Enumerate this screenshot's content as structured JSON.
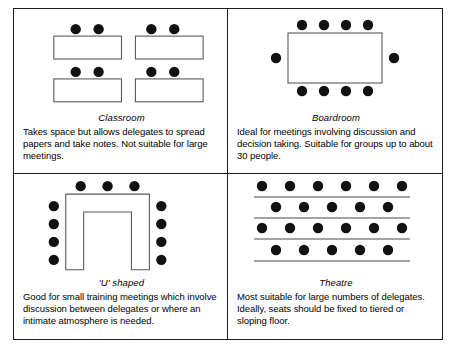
{
  "figure": {
    "panel_count": 4
  },
  "panels": [
    {
      "id": "classroom",
      "title": "Classroom",
      "description": "Takes space but allows delegates to spread papers and take notes. Not suitable for large meetings.",
      "diagram": {
        "type": "classroom",
        "tables": 4,
        "seats_per_table": 2,
        "total_seats": 8,
        "arrangement": "2 by 2 grid of rectangular tables, two delegates seated behind each table"
      }
    },
    {
      "id": "boardroom",
      "title": "Boardroom",
      "description": "Ideal for meetings involving discussion and decision taking. Suitable for groups up to about 30 people.",
      "diagram": {
        "type": "boardroom",
        "tables": 1,
        "seats_top": 4,
        "seats_bottom": 4,
        "seats_left": 1,
        "seats_right": 1,
        "total_seats": 10,
        "arrangement": "single large rectangular table with delegates seated all around"
      }
    },
    {
      "id": "u-shaped",
      "title": "'U' shaped",
      "description": "Good for small training meetings which involve discussion between delegates or where an intimate atmosphere is needed.",
      "diagram": {
        "type": "u-shaped",
        "seats_top": 3,
        "seats_left": 4,
        "seats_right": 4,
        "total_seats": 11,
        "arrangement": "tables forming an inverted U, delegates seated on the outside edges"
      }
    },
    {
      "id": "theatre",
      "title": "Theatre",
      "description": "Most suitable for large numbers of delegates. Ideally, seats should be fixed to tiered or sloping floor.",
      "diagram": {
        "type": "theatre",
        "rows": 4,
        "seats_per_row": [
          6,
          5,
          6,
          5
        ],
        "total_seats": 22,
        "arrangement": "four straight rows of seats facing the front, staggered alternately"
      }
    }
  ],
  "colors": {
    "seat": "#111111",
    "table_stroke": "#5a5a5a",
    "row_line": "#4a4a4a",
    "frame": "#1a1a1a",
    "background": "#ffffff"
  }
}
